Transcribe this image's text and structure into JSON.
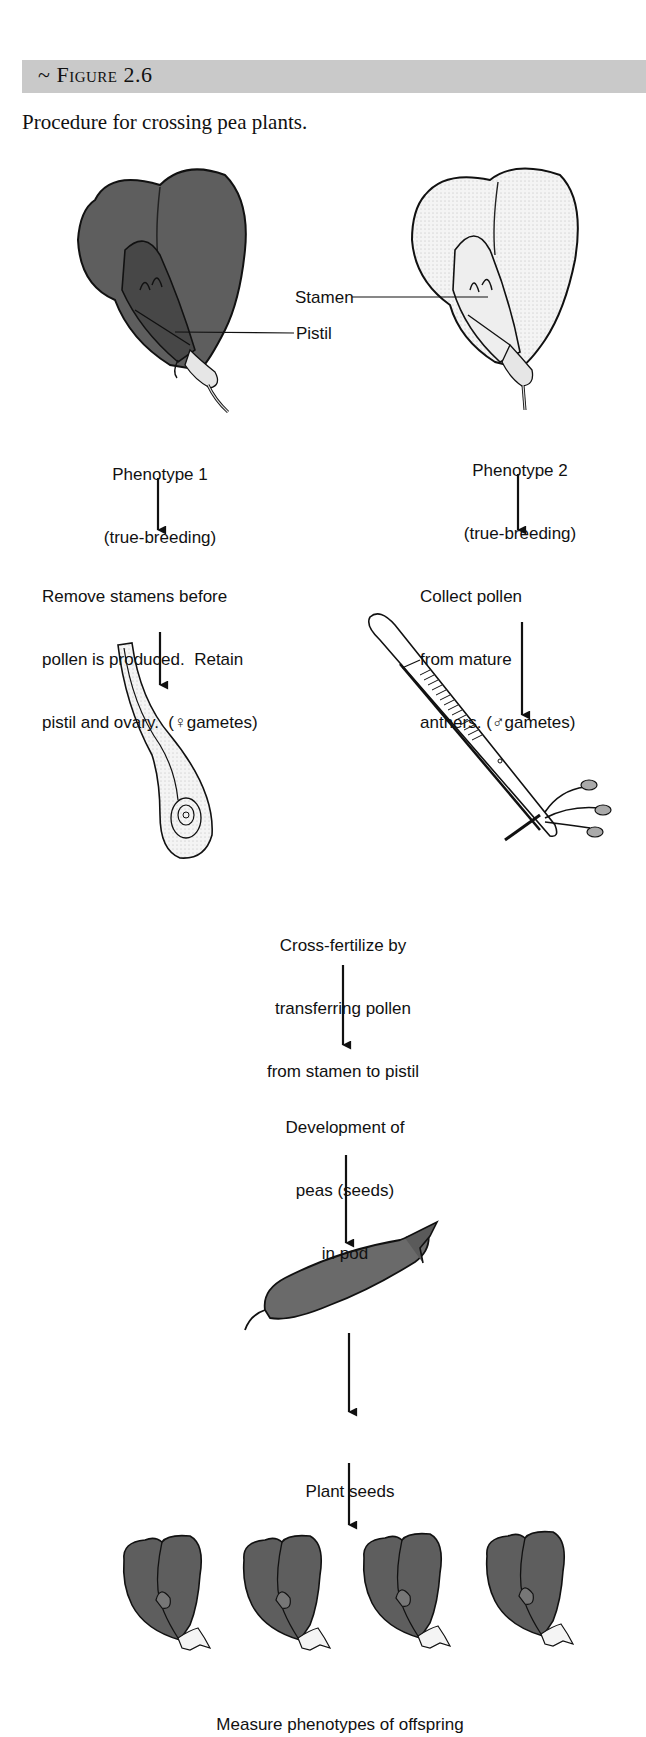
{
  "figure": {
    "number_label": "~ Figure 2.6",
    "caption": "Procedure for crossing pea plants."
  },
  "parents": {
    "phenotype1": {
      "title": "Phenotype 1",
      "subtitle": "(true-breeding)",
      "shade": "dark"
    },
    "phenotype2": {
      "title": "Phenotype 2",
      "subtitle": "(true-breeding)",
      "shade": "light"
    }
  },
  "callouts": {
    "stamen": "Stamen",
    "pistil": "Pistil"
  },
  "steps": {
    "female_prep": {
      "line1": "Remove stamens before",
      "line2": "pollen is produced.  Retain",
      "line3": "pistil and ovary.  (♀gametes)"
    },
    "male_prep": {
      "line1": "Collect pollen",
      "line2": "from mature",
      "line3": "anthers. (♂gametes)"
    },
    "cross": {
      "line1": "Cross-fertilize by",
      "line2": "transferring pollen",
      "line3": "from stamen to pistil"
    },
    "development": {
      "line1": "Development of",
      "line2": "peas (seeds)",
      "line3": "in pod"
    },
    "plant": {
      "line1": "Plant seeds"
    },
    "measure": {
      "line1": "Measure phenotypes of offspring"
    }
  },
  "illustrations": {
    "parent_flower_1": "dark-pea-flower-icon",
    "parent_flower_2": "light-pea-flower-icon",
    "pistil_ovary": "pistil-ovary-icon",
    "forceps": "forceps-with-anthers-icon",
    "pod": "pea-pod-icon",
    "offspring_count": 4,
    "offspring_flower": "offspring-pea-flower-icon"
  },
  "colors": {
    "header_bg": "#c9c9c9",
    "dark_fill": "#5e5e5e",
    "light_fill": "#f2f2f2",
    "ink": "#111111"
  }
}
